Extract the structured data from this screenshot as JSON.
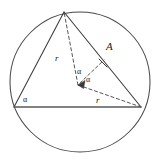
{
  "figure": {
    "type": "geometry-diagram",
    "canvas": {
      "width": 159,
      "height": 165,
      "background": "#ffffff"
    },
    "colors": {
      "stroke": "#3a3a3a",
      "circle_stroke": "#4a4a4a",
      "dashed_stroke": "#555555",
      "chord_stroke": "#5a5a5a",
      "text": "#1a1a1a"
    },
    "circle": {
      "name": "circumscribed-circle",
      "cx": 80,
      "cy": 82,
      "r": 70,
      "dashed": false
    },
    "points": {
      "top_vertex": {
        "name": "vertex-top",
        "x": 64,
        "y": 12
      },
      "left_vertex": {
        "name": "vertex-left",
        "x": 14,
        "y": 107
      },
      "right_vertex": {
        "name": "vertex-right",
        "x": 141,
        "y": 107
      },
      "center": {
        "name": "circle-center",
        "x": 78,
        "y": 85
      },
      "point_A": {
        "name": "point-a",
        "x": 105,
        "y": 58
      }
    },
    "solid_segments": [
      {
        "name": "side-top-to-left",
        "x1": 64,
        "y1": 12,
        "x2": 14,
        "y2": 107
      },
      {
        "name": "side-top-to-right",
        "x1": 64,
        "y1": 12,
        "x2": 141,
        "y2": 107
      },
      {
        "name": "base-left-to-right",
        "x1": 14,
        "y1": 107,
        "x2": 141,
        "y2": 107
      }
    ],
    "dashed_segments": [
      {
        "name": "radius-center-to-top",
        "x1": 78,
        "y1": 85,
        "x2": 64,
        "y2": 12
      },
      {
        "name": "radius-center-to-right",
        "x1": 78,
        "y1": 85,
        "x2": 141,
        "y2": 107
      },
      {
        "name": "radius-center-to-point-a",
        "x1": 78,
        "y1": 85,
        "x2": 105,
        "y2": 58
      }
    ],
    "tick_mark": {
      "name": "perpendicular-tick-at-a",
      "x1": 99,
      "y1": 59,
      "x2": 107,
      "y2": 67
    },
    "arrow_head": {
      "name": "arrowhead-at-center",
      "points": "78,85 84,80 83,88"
    },
    "labels": [
      {
        "name": "label-r-upper",
        "text": "r",
        "x": 55,
        "y": 54,
        "class": "lbl-r"
      },
      {
        "name": "label-r-lower",
        "text": "r",
        "x": 96,
        "y": 96,
        "class": "lbl-r"
      },
      {
        "name": "label-point-a",
        "text": "A",
        "x": 106,
        "y": 41,
        "class": "lbl-A"
      },
      {
        "name": "label-alpha-left-vertex",
        "text": "α",
        "x": 23,
        "y": 96,
        "class": "lbl-a"
      },
      {
        "name": "label-alpha-center-upper",
        "text": "α",
        "x": 77,
        "y": 68,
        "class": "lbl-a"
      },
      {
        "name": "label-alpha-center-lower",
        "text": "α",
        "x": 86,
        "y": 76,
        "class": "lbl-a"
      }
    ],
    "annotations": {
      "radius_symbol": "r",
      "angle_symbol": "α",
      "vertex_label": "A"
    }
  }
}
